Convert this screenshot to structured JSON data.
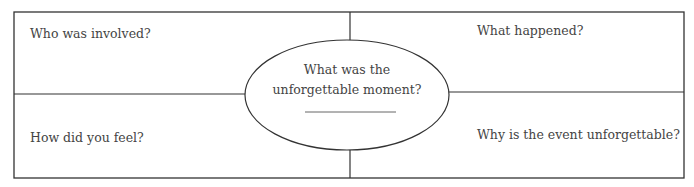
{
  "organizer": {
    "center": {
      "line1": "What was the",
      "line2": "unforgettable moment?",
      "answer_blank": ""
    },
    "quadrants": {
      "top_left": "Who was involved?",
      "top_right": "What happened?",
      "bottom_left": "How did you feel?",
      "bottom_right": "Why is the event unforgettable?"
    }
  }
}
